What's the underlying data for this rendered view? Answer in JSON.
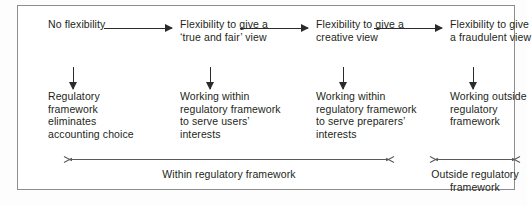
{
  "diagram": {
    "stages": [
      {
        "heading": "No flexibility",
        "outcome": "Regulatory framework eliminates accounting choice"
      },
      {
        "heading": "Flexibility to give a ‘true and fair’ view",
        "outcome": "Working within regulatory framework to serve users’ interests"
      },
      {
        "heading": "Flexibility to give a creative view",
        "outcome": "Working within regulatory framework to serve preparers’ interests"
      },
      {
        "heading": "Flexibility to give a fraudulent view",
        "outcome": "Working outside regulatory framework"
      }
    ],
    "ranges": [
      {
        "label": "Within regulatory framework"
      },
      {
        "label": "Outside regulatory framework"
      }
    ],
    "colors": {
      "text": "#231f20",
      "arrow": "#2b2b2b",
      "range_arrow": "#5a5a5a",
      "border": "#8d8d8d",
      "background": "#ffffff"
    }
  }
}
